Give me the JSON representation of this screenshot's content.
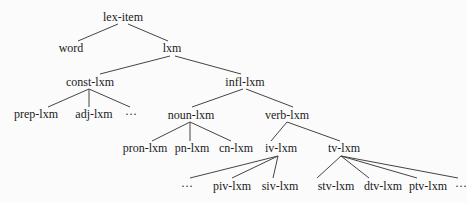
{
  "diagram": {
    "type": "type-hierarchy-tree",
    "line_color": "#444444",
    "text_color": "#1a1a1a",
    "nodes": [
      {
        "id": "lex-item",
        "label": "lex-item",
        "x": 123,
        "y": 17
      },
      {
        "id": "word",
        "label": "word",
        "x": 71,
        "y": 48
      },
      {
        "id": "lxm",
        "label": "lxm",
        "x": 172,
        "y": 48
      },
      {
        "id": "const-lxm",
        "label": "const-lxm",
        "x": 90,
        "y": 82
      },
      {
        "id": "infl-lxm",
        "label": "infl-lxm",
        "x": 245,
        "y": 82
      },
      {
        "id": "prep-lxm",
        "label": "prep-lxm",
        "x": 36,
        "y": 114
      },
      {
        "id": "adj-lxm",
        "label": "adj-lxm",
        "x": 94,
        "y": 114
      },
      {
        "id": "const-more",
        "label": "···",
        "x": 131,
        "y": 114
      },
      {
        "id": "noun-lxm",
        "label": "noun-lxm",
        "x": 191,
        "y": 115
      },
      {
        "id": "verb-lxm",
        "label": "verb-lxm",
        "x": 287,
        "y": 115
      },
      {
        "id": "pron-lxm",
        "label": "pron-lxm",
        "x": 145,
        "y": 148
      },
      {
        "id": "pn-lxm",
        "label": "pn-lxm",
        "x": 192,
        "y": 148
      },
      {
        "id": "cn-lxm",
        "label": "cn-lxm",
        "x": 236,
        "y": 148
      },
      {
        "id": "iv-lxm",
        "label": "iv-lxm",
        "x": 281,
        "y": 148
      },
      {
        "id": "tv-lxm",
        "label": "tv-lxm",
        "x": 344,
        "y": 148
      },
      {
        "id": "iv-more",
        "label": "···",
        "x": 187,
        "y": 186
      },
      {
        "id": "piv-lxm",
        "label": "piv-lxm",
        "x": 232,
        "y": 186
      },
      {
        "id": "siv-lxm",
        "label": "siv-lxm",
        "x": 280,
        "y": 186
      },
      {
        "id": "stv-lxm",
        "label": "stv-lxm",
        "x": 336,
        "y": 186
      },
      {
        "id": "dtv-lxm",
        "label": "dtv-lxm",
        "x": 383,
        "y": 186
      },
      {
        "id": "ptv-lxm",
        "label": "ptv-lxm",
        "x": 428,
        "y": 186
      },
      {
        "id": "tv-more",
        "label": "···",
        "x": 461,
        "y": 186
      }
    ],
    "edges": [
      {
        "from": "lex-item",
        "to": "word",
        "x1": 118,
        "y1": 24,
        "x2": 78,
        "y2": 41
      },
      {
        "from": "lex-item",
        "to": "lxm",
        "x1": 128,
        "y1": 24,
        "x2": 168,
        "y2": 41
      },
      {
        "from": "lxm",
        "to": "const-lxm",
        "x1": 170,
        "y1": 56,
        "x2": 100,
        "y2": 74
      },
      {
        "from": "lxm",
        "to": "infl-lxm",
        "x1": 175,
        "y1": 56,
        "x2": 241,
        "y2": 74
      },
      {
        "from": "const-lxm",
        "to": "prep-lxm",
        "x1": 89,
        "y1": 89,
        "x2": 48,
        "y2": 107
      },
      {
        "from": "const-lxm",
        "to": "adj-lxm",
        "x1": 89,
        "y1": 89,
        "x2": 89,
        "y2": 107
      },
      {
        "from": "const-lxm",
        "to": "const-more",
        "x1": 89,
        "y1": 89,
        "x2": 130,
        "y2": 107
      },
      {
        "from": "infl-lxm",
        "to": "noun-lxm",
        "x1": 243,
        "y1": 89,
        "x2": 192,
        "y2": 107
      },
      {
        "from": "infl-lxm",
        "to": "verb-lxm",
        "x1": 246,
        "y1": 89,
        "x2": 293,
        "y2": 107
      },
      {
        "from": "noun-lxm",
        "to": "pron-lxm",
        "x1": 190,
        "y1": 122,
        "x2": 152,
        "y2": 141
      },
      {
        "from": "noun-lxm",
        "to": "pn-lxm",
        "x1": 190,
        "y1": 122,
        "x2": 190,
        "y2": 141
      },
      {
        "from": "noun-lxm",
        "to": "cn-lxm",
        "x1": 190,
        "y1": 122,
        "x2": 231,
        "y2": 141
      },
      {
        "from": "verb-lxm",
        "to": "iv-lxm",
        "x1": 287,
        "y1": 122,
        "x2": 271,
        "y2": 141
      },
      {
        "from": "verb-lxm",
        "to": "tv-lxm",
        "x1": 287,
        "y1": 122,
        "x2": 340,
        "y2": 141
      },
      {
        "from": "iv-lxm",
        "to": "iv-more",
        "x1": 278,
        "y1": 156,
        "x2": 190,
        "y2": 178
      },
      {
        "from": "iv-lxm",
        "to": "piv-lxm",
        "x1": 278,
        "y1": 156,
        "x2": 232,
        "y2": 178
      },
      {
        "from": "iv-lxm",
        "to": "siv-lxm",
        "x1": 278,
        "y1": 156,
        "x2": 273,
        "y2": 178
      },
      {
        "from": "tv-lxm",
        "to": "stv-lxm",
        "x1": 341,
        "y1": 156,
        "x2": 317,
        "y2": 178
      },
      {
        "from": "tv-lxm",
        "to": "dtv-lxm",
        "x1": 341,
        "y1": 156,
        "x2": 369,
        "y2": 178
      },
      {
        "from": "tv-lxm",
        "to": "ptv-lxm",
        "x1": 341,
        "y1": 156,
        "x2": 417,
        "y2": 178
      },
      {
        "from": "tv-lxm",
        "to": "tv-more",
        "x1": 341,
        "y1": 156,
        "x2": 458,
        "y2": 178
      }
    ]
  }
}
